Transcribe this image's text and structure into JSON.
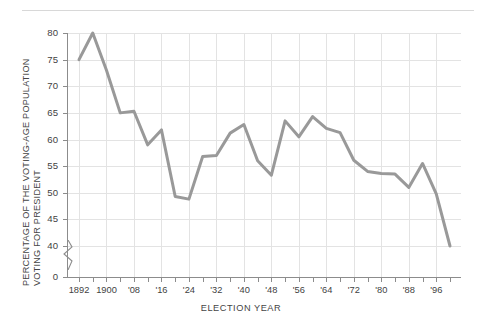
{
  "chart_data": {
    "type": "line",
    "title": "",
    "xlabel": "ELECTION YEAR",
    "ylabel": "PERCENTAGE OF THE VOTING-AGE POPULATION VOTING FOR PRESIDENT",
    "ylabel_line1": "PERCENTAGE OF THE VOTING-AGE POPULATION",
    "ylabel_line2": "VOTING FOR PRESIDENT",
    "ylim": [
      0,
      80
    ],
    "y_break": true,
    "y_break_between": [
      0,
      40
    ],
    "yticks": [
      0,
      40,
      45,
      50,
      55,
      60,
      65,
      70,
      75,
      80
    ],
    "ytick_labels": [
      "0",
      "40",
      "45",
      "50",
      "55",
      "60",
      "65",
      "70",
      "75",
      "80"
    ],
    "xticks_labeled": [
      "1892",
      "1900",
      "'08",
      "'16",
      "'24",
      "'32",
      "'40",
      "'48",
      "'56",
      "'64",
      "'72",
      "'80",
      "'88",
      "'96",
      "'02"
    ],
    "xlim": [
      1892,
      2000
    ],
    "x_step_years": 4,
    "grid": "both",
    "legend": "none",
    "series_color": "#999999",
    "line_width_px": 3,
    "x": [
      1892,
      1896,
      1900,
      1904,
      1908,
      1912,
      1916,
      1920,
      1924,
      1928,
      1932,
      1936,
      1940,
      1944,
      1948,
      1952,
      1956,
      1960,
      1964,
      1968,
      1972,
      1976,
      1980,
      1984,
      1988,
      1992,
      1996,
      2000
    ],
    "values": [
      75.0,
      80.0,
      73.0,
      65.0,
      65.3,
      59.0,
      61.8,
      49.3,
      48.8,
      56.8,
      57.0,
      61.2,
      62.8,
      56.0,
      53.3,
      63.5,
      60.5,
      64.3,
      62.1,
      61.3,
      56.1,
      54.0,
      53.6,
      53.5,
      51.0,
      55.5,
      49.8,
      40.0
    ],
    "ylim_labeled_min": 40,
    "ylim_labeled_max": 80
  },
  "axis": {
    "ytitle_line1": "PERCENTAGE OF THE VOTING-AGE POPULATION",
    "ytitle_line2": "VOTING FOR PRESIDENT",
    "xtitle": "ELECTION YEAR"
  }
}
